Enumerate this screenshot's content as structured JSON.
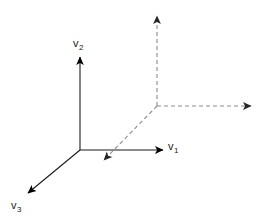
{
  "figure": {
    "background_color": "#ffffff",
    "width": 263,
    "height": 223
  },
  "colors": {
    "solid_axis": "#1a1a1a",
    "dashed_axis": "#8c8c8c",
    "label_text": "#1a1a1a",
    "arrowhead_solid": "#000000",
    "arrowhead_dashed": "#333333"
  },
  "origin": {
    "x": 80,
    "y": 150
  },
  "labels": {
    "v1": {
      "base": "v",
      "sub": "1"
    },
    "v2": {
      "base": "v",
      "sub": "2"
    },
    "v3": {
      "base": "v",
      "sub": "3"
    }
  },
  "axes": [
    {
      "name": "v1-axis",
      "style": "solid",
      "from": {
        "x": 80,
        "y": 150
      },
      "to": {
        "x": 163,
        "y": 150
      },
      "arrow": "end",
      "label": "v1"
    },
    {
      "name": "v2-axis",
      "style": "solid",
      "from": {
        "x": 80,
        "y": 150
      },
      "to": {
        "x": 80,
        "y": 57
      },
      "arrow": "end",
      "label": "v2"
    },
    {
      "name": "v3-axis",
      "style": "solid",
      "from": {
        "x": 80,
        "y": 150
      },
      "to": {
        "x": 28,
        "y": 193
      },
      "arrow": "end",
      "label": "v3"
    },
    {
      "name": "dashed-vertical-axis",
      "style": "dashed",
      "from": {
        "x": 157,
        "y": 106
      },
      "to": {
        "x": 157,
        "y": 15
      },
      "arrow": "end",
      "label": ""
    },
    {
      "name": "dashed-horizontal-axis",
      "style": "dashed",
      "from": {
        "x": 157,
        "y": 106
      },
      "to": {
        "x": 251,
        "y": 106
      },
      "arrow": "end",
      "label": ""
    },
    {
      "name": "dashed-diagonal-axis",
      "style": "dashed",
      "from": {
        "x": 157,
        "y": 106
      },
      "to": {
        "x": 104,
        "y": 160
      },
      "arrow": "end",
      "label": ""
    }
  ]
}
